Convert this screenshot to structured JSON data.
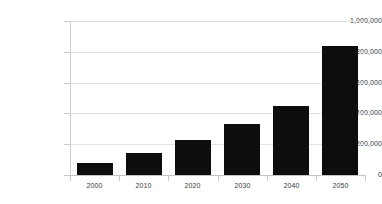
{
  "chart_data": {
    "type": "bar",
    "title": "",
    "subtitle": "",
    "xlabel": "",
    "ylabel": "",
    "categories": [
      "2000",
      "2010",
      "2020",
      "2030",
      "2040",
      "2050"
    ],
    "values": [
      75000,
      140000,
      225000,
      330000,
      450000,
      835000
    ],
    "series": [
      {
        "name": "",
        "values": [
          75000,
          140000,
          225000,
          330000,
          450000,
          835000
        ]
      }
    ],
    "ylim": [
      0,
      1000000
    ],
    "ytick_values": [
      0,
      200000,
      400000,
      600000,
      800000,
      1000000
    ],
    "ytick_labels": [
      "0",
      "200,000",
      "400,000",
      "600,000",
      "800,000",
      "1,000,000"
    ],
    "xtick_labels": [
      "2000",
      "2010",
      "2020",
      "2030",
      "2040",
      "2050"
    ],
    "grid": true,
    "grid_axis": "y",
    "legend": false,
    "legend_position": "none",
    "bar_color": "#0d0d0d",
    "gridline_color": "#e2e2e2",
    "axis_color": "#c4c4c4",
    "background_color": "#ffffff",
    "annotations": []
  }
}
